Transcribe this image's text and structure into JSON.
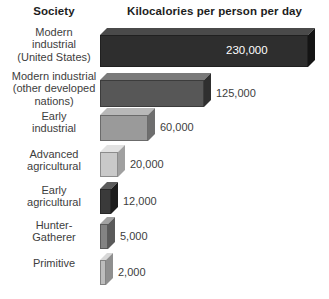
{
  "header": {
    "left_column": "Society",
    "right_column": "Kilocalories per person per day"
  },
  "chart_data": {
    "type": "bar",
    "title": "Kilocalories per person per day",
    "xlabel": "Kilocalories per person per day",
    "ylabel": "Society",
    "orientation": "horizontal",
    "grid": false,
    "legend": null,
    "xlim": [
      0,
      230000
    ],
    "categories": [
      "Modern industrial (United States)",
      "Modern industrial (other developed nations)",
      "Early industrial",
      "Advanced agricultural",
      "Early agricultural",
      "Hunter-Gatherer",
      "Primitive"
    ],
    "values": [
      230000,
      125000,
      60000,
      20000,
      12000,
      5000,
      2000
    ],
    "value_labels": [
      "230,000",
      "125,000",
      "60,000",
      "20,000",
      "12,000",
      "5,000",
      "2,000"
    ]
  },
  "rows": [
    {
      "label": "Modern\nindustrial\n(United States)",
      "value_label": "230,000",
      "value": 230000,
      "front_color": "#2e2e2e",
      "top_color": "#4a4a4a",
      "side_color": "#141414"
    },
    {
      "label": "Modern industrial\n(other developed\nnations)",
      "value_label": "125,000",
      "value": 125000,
      "front_color": "#575757",
      "top_color": "#7a7a7a",
      "side_color": "#2f2f2f"
    },
    {
      "label": "Early\nindustrial",
      "value_label": "60,000",
      "value": 60000,
      "front_color": "#9a9a9a",
      "top_color": "#b8b8b8",
      "side_color": "#6e6e6e"
    },
    {
      "label": "Advanced\nagricultural",
      "value_label": "20,000",
      "value": 20000,
      "front_color": "#c9c9c9",
      "top_color": "#e2e2e2",
      "side_color": "#a0a0a0"
    },
    {
      "label": "Early\nagricultural",
      "value_label": "12,000",
      "value": 12000,
      "front_color": "#3a3a3a",
      "top_color": "#5c5c5c",
      "side_color": "#1c1c1c"
    },
    {
      "label": "Hunter-\nGatherer",
      "value_label": "5,000",
      "value": 5000,
      "front_color": "#838383",
      "top_color": "#a2a2a2",
      "side_color": "#5a5a5a"
    },
    {
      "label": "Primitive",
      "value_label": "2,000",
      "value": 2000,
      "front_color": "#bdbdbd",
      "top_color": "#d8d8d8",
      "side_color": "#8f8f8f"
    }
  ],
  "geometry": {
    "bar_left": 100,
    "depth": 7,
    "rows_layout": [
      {
        "top": 28,
        "height": 32,
        "width": 208
      },
      {
        "top": 73,
        "height": 27,
        "width": 104
      },
      {
        "top": 108,
        "height": 26,
        "width": 48
      },
      {
        "top": 145,
        "height": 25,
        "width": 18
      },
      {
        "top": 182,
        "height": 25,
        "width": 11
      },
      {
        "top": 217,
        "height": 25,
        "width": 8
      },
      {
        "top": 253,
        "height": 25,
        "width": 6
      }
    ],
    "label_tops": [
      26,
      70,
      110,
      148,
      184,
      219,
      257
    ]
  }
}
